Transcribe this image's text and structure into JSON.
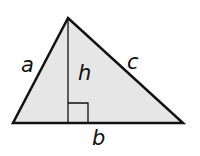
{
  "diagram": {
    "type": "triangle-with-altitude",
    "fill_color": "#e6e6e6",
    "stroke_color": "#111111",
    "vertices": {
      "apex": [
        68,
        18
      ],
      "base_left": [
        13,
        123
      ],
      "base_right": [
        183,
        123
      ]
    },
    "altitude_foot": [
      68,
      123
    ],
    "right_angle_marker": {
      "x": 68,
      "y": 103,
      "size": 20
    },
    "labels": {
      "side_left": "a",
      "side_right": "c",
      "base": "b",
      "height": "h"
    }
  }
}
